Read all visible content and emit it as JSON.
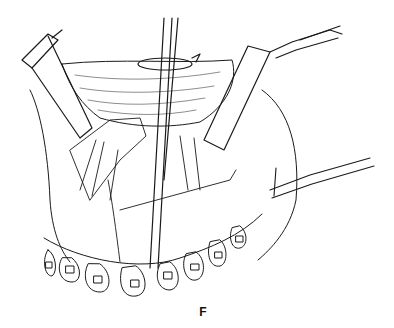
{
  "figure": {
    "label": "F",
    "colors": {
      "ink": "#1a1a1a",
      "background": "#ffffff"
    },
    "elements": {
      "rotation_arrow": "rotation-arrow-icon",
      "instrument": "vertical-rod",
      "left_retractor": "retractor",
      "right_retractor": "retractor",
      "lower_right_retractor": "retractor",
      "teeth_count": 8
    }
  }
}
